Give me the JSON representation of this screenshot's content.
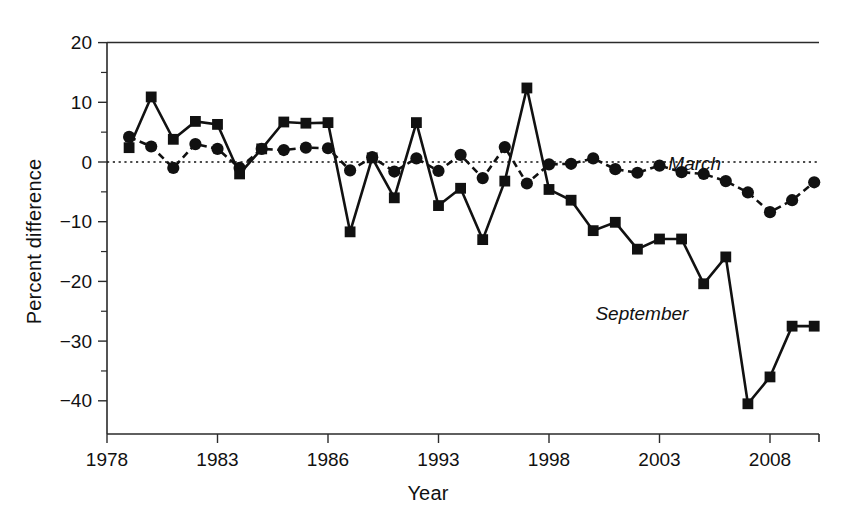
{
  "chart_data": {
    "type": "line",
    "title": "",
    "subtitle": "",
    "xlabel": "Year",
    "ylabel": "Percent difference",
    "xlim": [
      1978,
      2011
    ],
    "ylim": [
      -44,
      20
    ],
    "grid": false,
    "legend_position": "inline-annotation",
    "x_ticks": [
      1978,
      1983,
      1986,
      1993,
      1998,
      2003,
      2008
    ],
    "x_tick_labels": [
      "1978",
      "1983",
      "1986",
      "1993",
      "1998",
      "2003",
      "2008"
    ],
    "x_minor_tick_step": 1,
    "y_ticks": [
      20,
      10,
      0,
      -10,
      -20,
      -30,
      -40
    ],
    "y_tick_labels": [
      "20",
      "10",
      "0",
      "−10",
      "−20",
      "−30",
      "−40"
    ],
    "y_minor_ticks": [
      15,
      5,
      -5,
      -15,
      -25,
      -35
    ],
    "reference_line": {
      "value": 0,
      "style": "dotted"
    },
    "x": [
      1979,
      1980,
      1981,
      1982,
      1983,
      1984,
      1985,
      1986,
      1987,
      1988,
      1989,
      1990,
      1991,
      1992,
      1993,
      1994,
      1995,
      1996,
      1997,
      1998,
      1999,
      2000,
      2001,
      2002,
      2003,
      2004,
      2005,
      2006,
      2007,
      2008,
      2009,
      2010
    ],
    "series": [
      {
        "name": "March",
        "marker": "circle",
        "linestyle": "dashed",
        "color": "#111111",
        "values": [
          4.2,
          2.6,
          -1.0,
          3.0,
          2.2,
          -1.0,
          2.2,
          2.0,
          2.4,
          2.3,
          -1.4,
          0.8,
          -1.6,
          0.6,
          -1.5,
          1.2,
          -2.7,
          2.5,
          -3.6,
          -0.4,
          -0.3,
          0.6,
          -1.2,
          -1.8,
          -0.6,
          -1.7,
          -2.0,
          -3.2,
          -5.1,
          -8.4,
          -6.4,
          -3.4
        ]
      },
      {
        "name": "September",
        "marker": "square",
        "linestyle": "solid",
        "color": "#111111",
        "values": [
          2.4,
          10.9,
          3.8,
          6.8,
          6.3,
          -2.0,
          2.2,
          6.7,
          6.5,
          6.6,
          -11.7,
          0.7,
          -6.0,
          6.6,
          -7.3,
          -4.4,
          -13.0,
          -3.2,
          12.4,
          -4.6,
          -6.4,
          -11.5,
          -10.1,
          -14.6,
          -12.9,
          -12.9,
          -20.4,
          -15.9,
          -40.5,
          -36.0,
          -27.5,
          -27.5
        ]
      }
    ],
    "annotations": [
      {
        "text": "March",
        "x": 2003.4,
        "y": -1.3,
        "style": "italic"
      },
      {
        "text": "September",
        "x": 2000.1,
        "y": -26.5,
        "style": "italic"
      }
    ]
  }
}
